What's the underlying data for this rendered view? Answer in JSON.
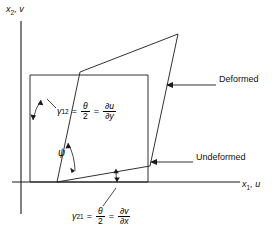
{
  "figure": {
    "title_implicit": "Shear strain of a deformed element",
    "background": "#ffffff",
    "line_color": "#1a1a1a",
    "axes": {
      "y_axis_label": "x2, v",
      "y_axis_base": "x",
      "y_axis_sub": "2",
      "y_axis_second": "v",
      "x_axis_label": "x1, u",
      "x_axis_base": "x",
      "x_axis_sub": "1",
      "x_axis_second": "u",
      "origin": [
        57,
        182
      ]
    },
    "callouts": [
      {
        "name": "deformed",
        "label": "Deformed",
        "leader_from": [
          216,
          85
        ],
        "leader_to": [
          168,
          85
        ]
      },
      {
        "name": "undeformed",
        "label": "Undeformed",
        "leader_from": [
          193,
          162
        ],
        "leader_to": [
          150,
          162
        ]
      }
    ],
    "angle_labels": {
      "psi": "ψ"
    },
    "equations": [
      {
        "name": "gamma-12",
        "gamma": "γ",
        "gamma_sub": "12",
        "eq1": "=",
        "frac1_num": "θ",
        "frac1_den": "2",
        "eq2": "=",
        "frac2_num": "∂u",
        "frac2_den": "∂y",
        "leader_from": [
          57,
          108
        ],
        "leader_to": [
          47,
          100
        ]
      },
      {
        "name": "gamma-21",
        "gamma": "γ",
        "gamma_sub": "21",
        "eq1": "=",
        "frac1_num": "θ",
        "frac1_den": "2",
        "eq2": "=",
        "frac2_num": "∂v",
        "frac2_den": "∂x",
        "leader_from": [
          104,
          205
        ],
        "leader_to": [
          116,
          188
        ]
      }
    ],
    "undeformed_rect": {
      "name": "undeformed-element",
      "points": "30,75 148,75 148,182 30,182"
    },
    "deformed_quad": {
      "name": "deformed-element",
      "points": "57,182 150,166 178,34 80,72"
    },
    "arcs": {
      "gamma12_arc": "upper-left angle between vertical and deformed left edge",
      "psi_arc": "angle between deformed left edge and deformed bottom edge",
      "gamma21_arc": "angle between x-axis and deformed bottom edge"
    }
  }
}
